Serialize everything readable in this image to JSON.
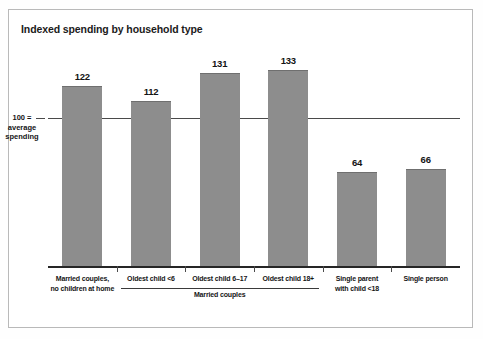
{
  "chart_data": {
    "type": "bar",
    "title": "Indexed spending by household type",
    "xlabel": "",
    "ylabel": "",
    "ylim": [
      0,
      145
    ],
    "grid": false,
    "legend": null,
    "reference_line": {
      "value": 100,
      "label_lines": [
        "100 =",
        "average",
        "spending"
      ]
    },
    "categories": [
      "Married couples,\nno children at home",
      "Oldest child <6",
      "Oldest child 6–17",
      "Oldest child 18+",
      "Single parent\nwith child <18",
      "Single person"
    ],
    "values": [
      122,
      112,
      131,
      133,
      64,
      66
    ],
    "group_brackets": [
      {
        "label": "Married couples",
        "from_index": 1,
        "to_index": 3
      }
    ],
    "bar_color": "#8d8d8d"
  },
  "bars": [
    {
      "value": "122",
      "label_line1": "Married couples,",
      "label_line2": "no children at home"
    },
    {
      "value": "112",
      "label_line1": "Oldest child <6",
      "label_line2": ""
    },
    {
      "value": "131",
      "label_line1": "Oldest child 6–17",
      "label_line2": ""
    },
    {
      "value": "133",
      "label_line1": "Oldest child 18+",
      "label_line2": ""
    },
    {
      "value": "64",
      "label_line1": "Single parent",
      "label_line2": "with child <18"
    },
    {
      "value": "66",
      "label_line1": "Single person",
      "label_line2": ""
    }
  ],
  "axis": {
    "reference_label_line1": "100 =",
    "reference_label_line2": "average",
    "reference_label_line3": "spending"
  },
  "group": {
    "label": "Married couples"
  },
  "colors": {
    "bar": "#8d8d8d",
    "bar_edge": "#6f6f6f",
    "axis": "#262626",
    "reference_line": "#4a4a4a",
    "frame": "#b9b9b9",
    "text": "#151515",
    "background": "#ffffff"
  }
}
